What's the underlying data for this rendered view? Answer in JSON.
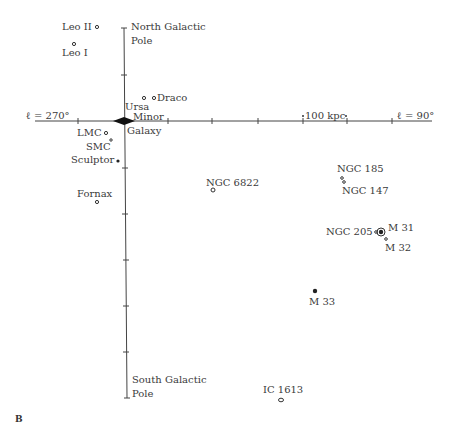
{
  "figure_label": "B",
  "axes": {
    "left_label": "ℓ = 270°",
    "right_label": "ℓ = 90°",
    "scale_label": "100 kpc",
    "top_label_line1": "North Galactic",
    "top_label_line2": "Pole",
    "bottom_label_line1": "South Galactic",
    "bottom_label_line2": "Pole"
  },
  "center": {
    "label": "Galaxy"
  },
  "galaxies": [
    {
      "name": "Leo II",
      "label": "Leo II"
    },
    {
      "name": "Leo I",
      "label": "Leo I"
    },
    {
      "name": "Draco",
      "label": "Draco"
    },
    {
      "name": "Ursa Minor",
      "label_line1": "Ursa",
      "label_line2": "Minor"
    },
    {
      "name": "LMC",
      "label": "LMC"
    },
    {
      "name": "SMC",
      "label": "SMC"
    },
    {
      "name": "Sculptor",
      "label": "Sculptor"
    },
    {
      "name": "Fornax",
      "label": "Fornax"
    },
    {
      "name": "NGC 6822",
      "label": "NGC 6822"
    },
    {
      "name": "NGC 185",
      "label": "NGC 185"
    },
    {
      "name": "NGC 147",
      "label": "NGC 147"
    },
    {
      "name": "NGC 205",
      "label": "NGC 205"
    },
    {
      "name": "M 31",
      "label": "M 31"
    },
    {
      "name": "M 32",
      "label": "M 32"
    },
    {
      "name": "M 33",
      "label": "M 33"
    },
    {
      "name": "IC 1613",
      "label": "IC 1613"
    }
  ]
}
